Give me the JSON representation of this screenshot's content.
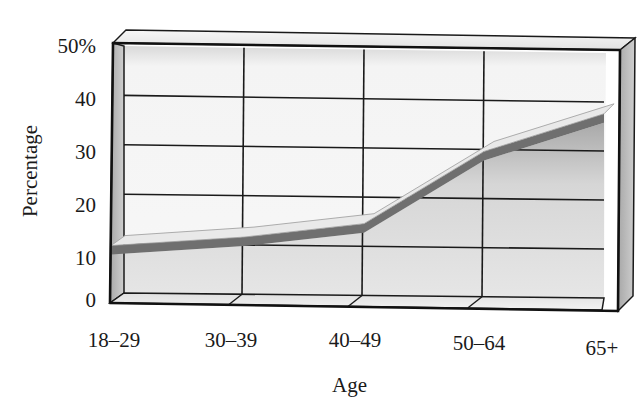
{
  "chart_data": {
    "type": "line",
    "title": "",
    "xlabel": "Age",
    "ylabel": "Percentage",
    "categories": [
      "18–29",
      "30–39",
      "40–49",
      "50–64",
      "65+"
    ],
    "series": [
      {
        "name": "Percentage",
        "values": [
          10,
          12,
          15,
          30,
          38
        ]
      }
    ],
    "ylim": [
      0,
      50
    ],
    "yticks": [
      "0",
      "10",
      "20",
      "30",
      "40",
      "50%"
    ],
    "grid": true,
    "legend": null,
    "style": "3d ribbon line in a box frame"
  },
  "labels": {
    "x_axis": "Age",
    "y_axis": "Percentage"
  },
  "colors": {
    "ribbon_top": "#e8e8e8",
    "ribbon_side": "#6e6e6e",
    "back_wall": "#f2f2f2",
    "fill_under": "#cfcfcf",
    "frame": "#1a1a1a",
    "side_panel": "#b8b8b8"
  }
}
